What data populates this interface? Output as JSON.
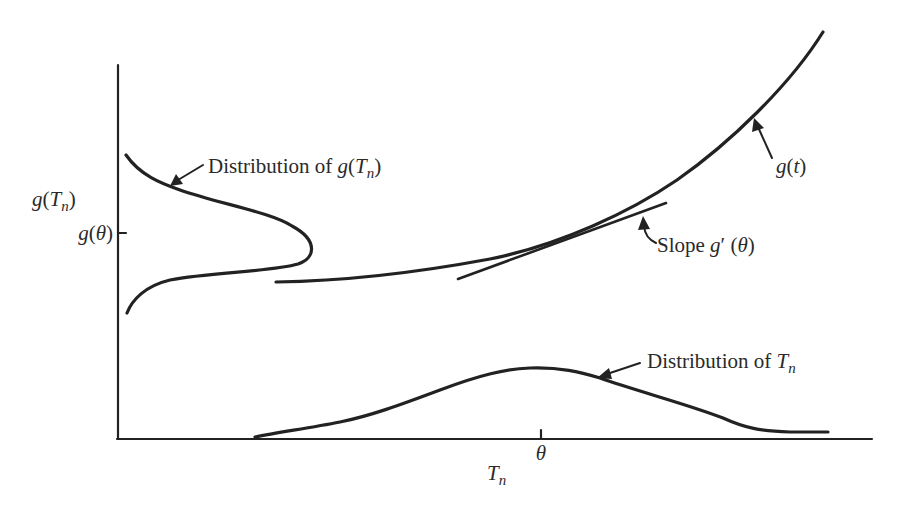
{
  "figure": {
    "background": "#ffffff",
    "ink_color": "#222222",
    "axes": {
      "y_axis_label": {
        "func": "g",
        "open": "(",
        "var": "T",
        "sub": "n",
        "close": ")"
      },
      "y_tick_label": {
        "func": "g",
        "open": "(",
        "var": "θ",
        "close": ")"
      },
      "x_axis_label": {
        "var": "T",
        "sub": "n"
      },
      "x_tick_label": "θ"
    },
    "annotations": {
      "dist_g": {
        "prefix": "Distribution of ",
        "func": "g",
        "open": "(",
        "var": "T",
        "sub": "n",
        "close": ")"
      },
      "curve_g": {
        "func": "g",
        "open": "(",
        "var": "t",
        "close": ")"
      },
      "slope": {
        "prefix": "Slope ",
        "func": "g",
        "prime": "′",
        "open": " (",
        "var": "θ",
        "close": ")"
      },
      "dist_T": {
        "prefix": "Distribution of ",
        "var": "T",
        "sub": "n"
      }
    },
    "curves": [
      {
        "name": "g(t)",
        "kind": "convex increasing curve"
      },
      {
        "name": "tangent at θ",
        "kind": "straight line with slope g′(θ)"
      },
      {
        "name": "distribution of T_n",
        "kind": "skewed density on horizontal axis, peak near θ"
      },
      {
        "name": "distribution of g(T_n)",
        "kind": "density drawn sideways on vertical axis, peak near g(θ)"
      }
    ]
  }
}
